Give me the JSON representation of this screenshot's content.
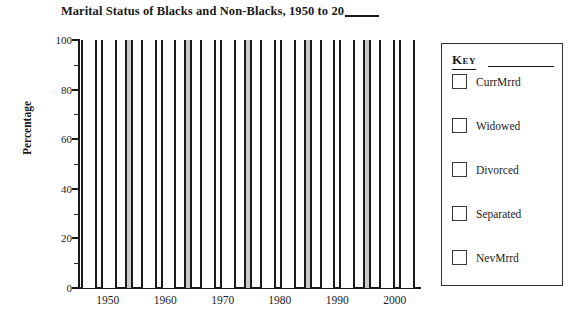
{
  "chart_data": {
    "type": "bar",
    "title": "Marital Status of Blacks and Non-Blacks, 1950 to 20",
    "title_blank_suffix": "____",
    "xlabel": "",
    "ylabel": "Percentage",
    "ylim": [
      0,
      100
    ],
    "y_ticks": [
      0,
      20,
      40,
      60,
      80,
      100
    ],
    "y_minor_ticks": [
      10,
      30,
      50,
      70,
      90
    ],
    "x_tick_labels": [
      "1950",
      "1960",
      "1970",
      "1980",
      "1990",
      "2000"
    ],
    "grid": false,
    "legend_position": "right",
    "note": "Blank worksheet template: all bars are drawn empty (unfilled, full height 0-100) so values can be filled in by hand. Shaded grey bars mark alternating reference columns.",
    "series": [
      {
        "name": "CurrMrrd",
        "values": []
      },
      {
        "name": "Widowed",
        "values": []
      },
      {
        "name": "Divorced",
        "values": []
      },
      {
        "name": "Separated",
        "values": []
      },
      {
        "name": "NevMrrd",
        "values": []
      }
    ],
    "bars": [
      {
        "shaded": false
      },
      {
        "shaded": false
      },
      {
        "shaded": true
      },
      {
        "shaded": false
      },
      {
        "shaded": false
      },
      {
        "shaded": true
      },
      {
        "shaded": false
      },
      {
        "shaded": false
      },
      {
        "shaded": true
      },
      {
        "shaded": false
      },
      {
        "shaded": false
      },
      {
        "shaded": true
      },
      {
        "shaded": false
      },
      {
        "shaded": false
      },
      {
        "shaded": true
      },
      {
        "shaded": false
      },
      {
        "shaded": false
      }
    ]
  },
  "chart": {
    "title_main": "Marital Status of Blacks and Non-Blacks, 1950 to 20",
    "y_axis_title": "Percentage",
    "y_ticks": [
      {
        "label": "100",
        "value": 100
      },
      {
        "label": "80",
        "value": 80
      },
      {
        "label": "60",
        "value": 60
      },
      {
        "label": "40",
        "value": 40
      },
      {
        "label": "20",
        "value": 20
      },
      {
        "label": "0",
        "value": 0
      }
    ],
    "y_minor_values": [
      90,
      70,
      50,
      30,
      10
    ],
    "x_ticks": [
      {
        "label": "1950",
        "pos": 0.085
      },
      {
        "label": "1960",
        "pos": 0.255
      },
      {
        "label": "1970",
        "pos": 0.425
      },
      {
        "label": "1980",
        "pos": 0.594
      },
      {
        "label": "1990",
        "pos": 0.764
      },
      {
        "label": "2000",
        "pos": 0.934
      }
    ]
  },
  "legend": {
    "title": "Key",
    "items": [
      {
        "label": "CurrMrrd",
        "swatch": "empty"
      },
      {
        "label": "Widowed",
        "swatch": "empty"
      },
      {
        "label": "Divorced",
        "swatch": "empty"
      },
      {
        "label": "Separated",
        "swatch": "empty"
      },
      {
        "label": "NevMrrd",
        "swatch": "empty"
      }
    ]
  },
  "colors": {
    "ink": "#1a1a1a",
    "shaded_bar": "#c9c9c9",
    "bar_fill": "#ffffff",
    "legend_border": "#333333"
  }
}
